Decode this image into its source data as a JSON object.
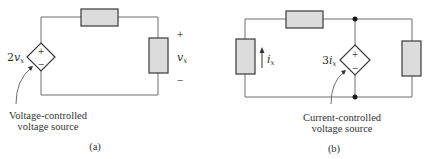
{
  "diagrams": [
    {
      "id": "a",
      "caption": "(a)",
      "source_label_coef": "2",
      "source_label_var": "v",
      "source_label_sub": "x",
      "source_plus": "+",
      "source_minus": "−",
      "measured_plus": "+",
      "measured_var": "v",
      "measured_sub": "x",
      "measured_minus": "−",
      "annotation_line1": "Voltage-controlled",
      "annotation_line2": "voltage source"
    },
    {
      "id": "b",
      "caption": "(b)",
      "source_label_coef": "3",
      "source_label_var": "i",
      "source_label_sub": "x",
      "source_plus": "+",
      "source_minus": "−",
      "current_var": "i",
      "current_sub": "x",
      "annotation_line1": "Current-controlled",
      "annotation_line2": "voltage source"
    }
  ],
  "colors": {
    "resistor_fill": "#dcdcdc",
    "wire": "#6e6e6e",
    "outline": "#3a3a3a"
  }
}
